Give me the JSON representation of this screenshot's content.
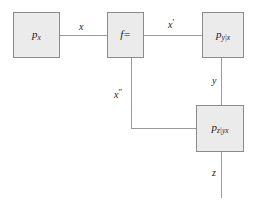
{
  "diagram": {
    "background_color": "#ffffff",
    "node_fill_color": "#ebebeb",
    "node_border_color": "#8a8a8a",
    "edge_color": "#9a9a9a",
    "text_color": "#1a1a1a",
    "nodes": [
      {
        "id": "px",
        "label_base": "p",
        "label_sub": "x",
        "name": "node-p-x"
      },
      {
        "id": "f",
        "label_base": "f=",
        "label_sub": "",
        "name": "node-f-equals"
      },
      {
        "id": "pyx",
        "label_base": "p",
        "label_sub": "y|x",
        "name": "node-p-y-given-x"
      },
      {
        "id": "pzyx",
        "label_base": "p",
        "label_sub": "z|yx",
        "name": "node-p-z-given-yx"
      }
    ],
    "edges": [
      {
        "id": "x",
        "label": "x",
        "prime": "",
        "from": "px",
        "to": "f"
      },
      {
        "id": "xprime",
        "label": "x",
        "prime": "′",
        "from": "f",
        "to": "pyx"
      },
      {
        "id": "xdprime",
        "label": "x",
        "prime": "″",
        "from": "f",
        "to": "pzyx"
      },
      {
        "id": "y",
        "label": "y",
        "prime": "",
        "from": "pyx",
        "to": "pzyx"
      },
      {
        "id": "z",
        "label": "z",
        "prime": "",
        "from": "pzyx",
        "to": ""
      }
    ]
  }
}
